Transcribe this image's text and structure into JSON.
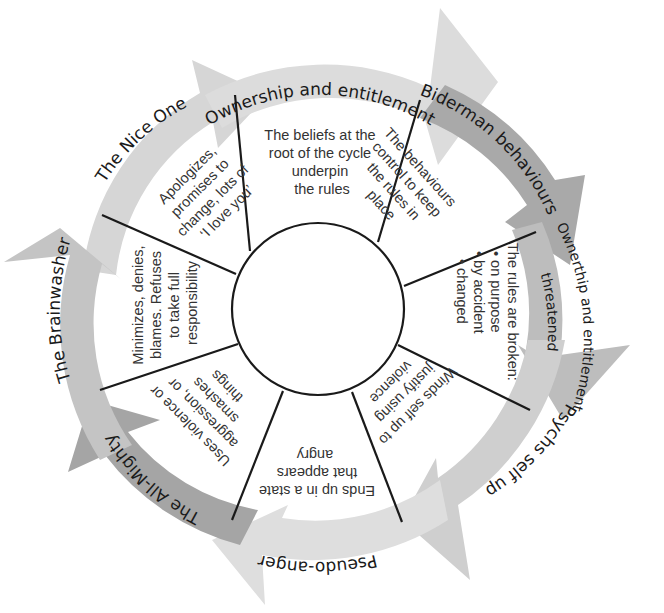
{
  "diagram": {
    "type": "cycle-wheel",
    "center_circle_label": "",
    "ring": [
      {
        "id": "ownership",
        "label": "Ownership and entitlement",
        "shade": "#dcdcdc"
      },
      {
        "id": "biderman",
        "label": "Biderman behaviours",
        "shade": "#a9a9a9"
      },
      {
        "id": "threatened",
        "label_line1": "Ownerthip and entitlement",
        "label_line2": "threatened",
        "shade": "#bdbdbd"
      },
      {
        "id": "psychs",
        "label": "Psychs self up",
        "shade": "#cfcfcf"
      },
      {
        "id": "pseudo",
        "label": "Pseudo-anger",
        "shade": "#dedede"
      },
      {
        "id": "allmighty",
        "label": "The All-Mighty",
        "shade": "#a5a5a5"
      },
      {
        "id": "brainwasher",
        "label": "The Brainwasher",
        "shade": "#c4c4c4"
      },
      {
        "id": "niceone",
        "label": "The Nice One",
        "shade": "#d6d6d6"
      }
    ],
    "segments": [
      {
        "id": "beliefs",
        "lines": [
          "The beliefs at the",
          "root of the cycle",
          "underpin",
          "the rules"
        ]
      },
      {
        "id": "behaviours",
        "lines": [
          "The behaviours",
          "control to keep",
          "the rules in",
          "place"
        ]
      },
      {
        "id": "rules-broken",
        "lines": [
          "The rules are broken:",
          "• on purpose",
          "• by accident",
          "• changed"
        ]
      },
      {
        "id": "winds-self-up",
        "lines": [
          "Winds self up to",
          "justify using",
          "violence"
        ]
      },
      {
        "id": "ends-up",
        "lines": [
          "Ends up in a state",
          "that appears",
          "angry"
        ]
      },
      {
        "id": "uses-violence",
        "lines": [
          "Uses violence or",
          "aggression, or",
          "smashes",
          "things"
        ]
      },
      {
        "id": "minimizes",
        "lines": [
          "Minimizes, denies,",
          "blames. Refuses",
          "to take full",
          "responsibility"
        ]
      },
      {
        "id": "apologizes",
        "lines": [
          "Apologizes,",
          "promises to",
          "change, lots of",
          "‘I love you’"
        ]
      }
    ],
    "colors": {
      "line": "#1a1a1a",
      "text": "#333333",
      "background": "#ffffff"
    }
  }
}
